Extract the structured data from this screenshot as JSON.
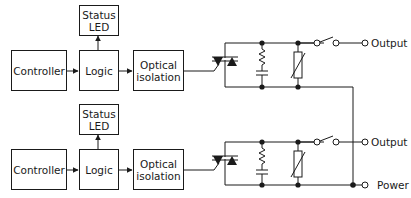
{
  "channels": [
    {
      "controller": "Controller",
      "logic": "Logic",
      "status_led": "Status\nLED",
      "optical_isolation": "Optical\nisolation",
      "output_label": "Output"
    },
    {
      "controller": "Controller",
      "logic": "Logic",
      "status_led": "Status\nLED",
      "optical_isolation": "Optical\nisolation",
      "output_label": "Output"
    }
  ],
  "power_label": "Power",
  "colors": {
    "line": "#1a1a1a",
    "background": "#ffffff"
  }
}
